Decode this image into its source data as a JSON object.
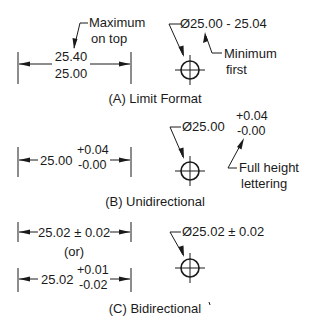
{
  "sections": {
    "a": {
      "caption": "(A) Limit Format",
      "linear": {
        "upper": "25.40",
        "lower": "25.00"
      },
      "linear_note": {
        "line1": "Maximum",
        "line2": "on top"
      },
      "diameter": {
        "text": "Ø25.00 - 25.04"
      },
      "diameter_note": {
        "line1": "Minimum",
        "line2": "first"
      }
    },
    "b": {
      "caption": "(B) Unidirectional",
      "linear": {
        "nominal": "25.00",
        "plus": "+0.04",
        "minus": "-0.00"
      },
      "diameter": {
        "nominal": "Ø25.00",
        "plus": "+0.04",
        "minus": "-0.00"
      },
      "diameter_note": {
        "line1": "Full height",
        "line2": "lettering"
      }
    },
    "c": {
      "caption": "(C) Bidirectional",
      "linear1": {
        "text": "25.02 ± 0.02"
      },
      "or_label": "(or)",
      "linear2": {
        "nominal": "25.02",
        "plus": "+0.01",
        "minus": "-0.02"
      },
      "diameter": {
        "text": "Ø25.02 ± 0.02"
      }
    }
  }
}
